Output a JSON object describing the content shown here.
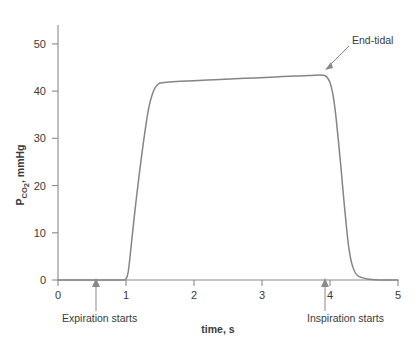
{
  "chart_data": {
    "type": "line",
    "title": "",
    "xlabel": "time, s",
    "ylabel_main": "P",
    "ylabel_sub": "CO",
    "ylabel_sub2": "2",
    "ylabel_tail": ", mmHg",
    "ylabel_plain": "PCO2, mmHg",
    "xlim": [
      0,
      5
    ],
    "ylim": [
      0,
      54
    ],
    "xticks": [
      0,
      1,
      2,
      3,
      4,
      5
    ],
    "xtick_labels": [
      "0",
      "1",
      "2",
      "3",
      "4",
      "5"
    ],
    "yticks": [
      0,
      10,
      20,
      30,
      40,
      50
    ],
    "ytick_labels": [
      "0",
      "10",
      "20",
      "30",
      "40",
      "50"
    ],
    "grid": false,
    "legend": "none",
    "series": [
      {
        "name": "PCO2 waveform",
        "color": "#858585",
        "x": [
          0.0,
          0.2,
          0.4,
          0.6,
          0.8,
          0.95,
          1.0,
          1.03,
          1.06,
          1.1,
          1.15,
          1.2,
          1.25,
          1.3,
          1.34,
          1.38,
          1.42,
          1.46,
          1.5,
          1.6,
          1.8,
          2.0,
          2.3,
          2.6,
          2.9,
          3.2,
          3.5,
          3.7,
          3.85,
          3.92,
          3.96,
          4.0,
          4.04,
          4.08,
          4.12,
          4.16,
          4.2,
          4.24,
          4.28,
          4.33,
          4.4,
          4.55,
          4.75,
          5.0
        ],
        "y": [
          0.0,
          0.0,
          0.0,
          0.0,
          0.0,
          0.0,
          0.2,
          1.5,
          5.0,
          10.5,
          17.0,
          23.0,
          28.5,
          33.5,
          36.8,
          39.0,
          40.5,
          41.3,
          41.7,
          41.9,
          42.1,
          42.2,
          42.4,
          42.6,
          42.8,
          43.0,
          43.2,
          43.3,
          43.4,
          43.3,
          42.9,
          41.8,
          39.5,
          35.5,
          30.0,
          24.0,
          17.5,
          11.5,
          6.5,
          3.0,
          1.0,
          0.2,
          0.0,
          0.0
        ]
      }
    ],
    "annotations": [
      {
        "name": "end-tidal",
        "label": "End-tidal",
        "x": 4.3,
        "y": 50.5,
        "points_to_x": 3.96,
        "points_to_y": 45.5
      },
      {
        "name": "expiration-starts",
        "label": "Expiration starts",
        "x": 0.56,
        "y": 0,
        "arrow": "up"
      },
      {
        "name": "inspiration-starts",
        "label": "Inspiration starts",
        "x": 3.93,
        "y": 0,
        "arrow": "up"
      }
    ],
    "colors": {
      "curve": "#858585",
      "axis": "#8a8a8a",
      "text": "#3a3a3a",
      "background": "#ffffff"
    }
  }
}
